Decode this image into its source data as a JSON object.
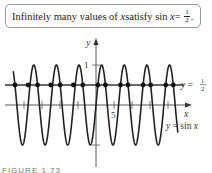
{
  "callout": {
    "prefix": "Infinitely many values of ",
    "var1": "x",
    "middle": " satisfy sin ",
    "var2": "x",
    "equals": " = ",
    "frac_num": "1",
    "frac_den": "2",
    "suffix": "."
  },
  "graph": {
    "y_axis_label": "y",
    "x_axis_label": "x",
    "y_tick_1": "1",
    "x_tick_5": "5",
    "line_label_prefix": "y = ",
    "line_label_num": "1",
    "line_label_den": "2",
    "curve_label": "y = sin x"
  },
  "caption": "FIGURE 1.73",
  "chart_data": {
    "type": "line",
    "xlabel": "x",
    "ylabel": "y",
    "xlim": [
      -23,
      23
    ],
    "ylim": [
      -1,
      1
    ],
    "x_ticks": [
      -20,
      -15,
      -10,
      -5,
      5,
      10,
      15,
      20
    ],
    "x_tick_labels_shown": {
      "5": "5"
    },
    "y_ticks": [
      1,
      -1
    ],
    "y_tick_labels_shown": {
      "1": "1"
    },
    "series": [
      {
        "name": "y = sin x",
        "function": "sin(x)"
      },
      {
        "name": "y = 1/2",
        "function": "0.5"
      }
    ],
    "intersection_points_x": [
      -22.51,
      -18.85,
      -16.23,
      -12.57,
      -9.95,
      -6.28,
      -3.67,
      0.52,
      2.62,
      6.81,
      8.9,
      13.09,
      15.18,
      19.37,
      21.47
    ],
    "intersection_y": 0.5,
    "grid": false
  }
}
